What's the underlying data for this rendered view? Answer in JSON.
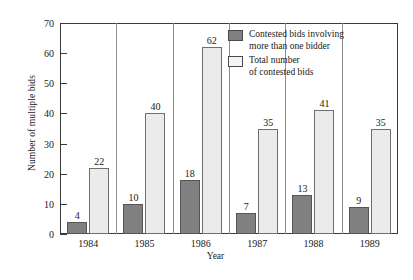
{
  "chart_data": {
    "type": "bar",
    "title": "",
    "xlabel": "Year",
    "ylabel": "Number of multiple bids",
    "categories": [
      "1984",
      "1985",
      "1986",
      "1987",
      "1988",
      "1989"
    ],
    "series": [
      {
        "name": "Contested bids involving\nmore than one bidder",
        "color": "#808080",
        "values": [
          4,
          10,
          18,
          7,
          13,
          9
        ]
      },
      {
        "name": "Total number\nof contested bids",
        "color": "#ebebeb",
        "values": [
          22,
          40,
          62,
          35,
          41,
          35
        ]
      }
    ],
    "ylim": [
      0,
      70
    ],
    "yticks": [
      0,
      10,
      20,
      30,
      40,
      50,
      60,
      70
    ],
    "grid": false,
    "legend_position": "top-right",
    "value_labels": true
  },
  "legend": {
    "entries": [
      {
        "label": "Contested bids involving\nmore than one bidder",
        "swatch": "dark-gray-swatch"
      },
      {
        "label": "Total number\nof contested bids",
        "swatch": "white-swatch"
      }
    ]
  }
}
